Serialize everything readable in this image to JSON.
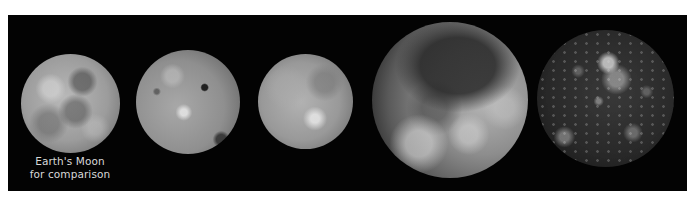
{
  "figure": {
    "background_color": "#030303",
    "moons": [
      {
        "id": "earths-moon",
        "label_lines": [
          "Earth's Moon",
          "for comparison"
        ]
      },
      {
        "id": "io"
      },
      {
        "id": "europa"
      },
      {
        "id": "ganymede"
      },
      {
        "id": "callisto"
      }
    ]
  }
}
